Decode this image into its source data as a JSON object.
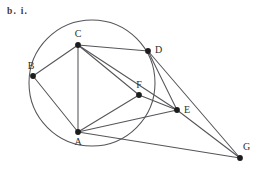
{
  "figure": {
    "part_label": "b. i.",
    "width": 258,
    "height": 173,
    "background_color": "#ffffff",
    "stroke_color": "#55555a",
    "vertex_color": "#1c1c1c",
    "label_color": "#2e2e2e"
  },
  "circle": {
    "name": "circumcircle",
    "cx": 92,
    "cy": 83,
    "r": 63,
    "passes_through": [
      "A",
      "B",
      "C",
      "D"
    ]
  },
  "vertices": [
    {
      "id": "A",
      "label": "A",
      "x": 78,
      "y": 132,
      "label_x": 78,
      "label_y": 145,
      "label_anchor": "middle"
    },
    {
      "id": "B",
      "label": "B",
      "x": 33,
      "y": 76,
      "label_x": 31,
      "label_y": 69,
      "label_anchor": "middle"
    },
    {
      "id": "C",
      "label": "C",
      "x": 78,
      "y": 45,
      "label_x": 78,
      "label_y": 37,
      "label_anchor": "middle"
    },
    {
      "id": "D",
      "label": "D",
      "x": 148,
      "y": 51,
      "label_x": 155,
      "label_y": 53,
      "label_anchor": "start"
    },
    {
      "id": "E",
      "label": "E",
      "x": 177,
      "y": 110,
      "label_x": 184,
      "label_y": 113,
      "label_anchor": "start"
    },
    {
      "id": "F",
      "label": "F",
      "x": 139,
      "y": 95,
      "label_x": 139,
      "label_y": 88,
      "label_anchor": "middle"
    },
    {
      "id": "G",
      "label": "G",
      "x": 240,
      "y": 158,
      "label_x": 243,
      "label_y": 150,
      "label_anchor": "start"
    }
  ],
  "edges": [
    {
      "from": "B",
      "to": "C"
    },
    {
      "from": "B",
      "to": "A"
    },
    {
      "from": "C",
      "to": "A"
    },
    {
      "from": "C",
      "to": "D"
    },
    {
      "from": "C",
      "to": "F"
    },
    {
      "from": "C",
      "to": "E"
    },
    {
      "from": "D",
      "to": "E"
    },
    {
      "from": "D",
      "to": "G"
    },
    {
      "from": "F",
      "to": "A"
    },
    {
      "from": "F",
      "to": "E"
    },
    {
      "from": "A",
      "to": "E"
    },
    {
      "from": "A",
      "to": "G"
    },
    {
      "from": "E",
      "to": "G"
    }
  ]
}
